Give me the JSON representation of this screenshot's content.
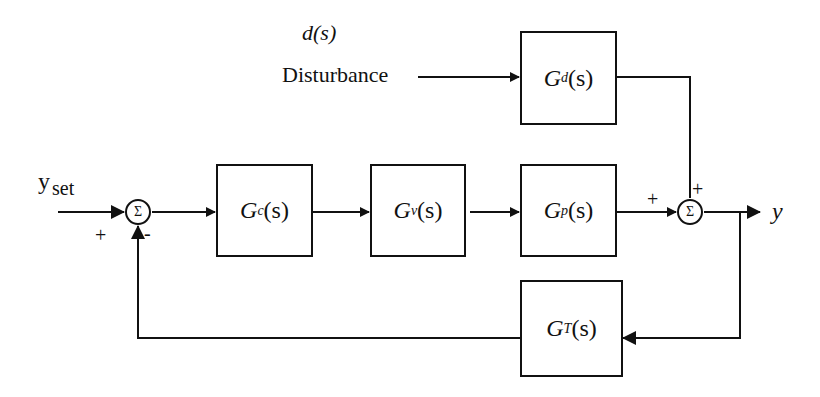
{
  "diagram": {
    "type": "feedback control block diagram",
    "inputs": {
      "setpoint": {
        "symbol": "y",
        "subscript": "set"
      },
      "disturbance_symbol": "d(s)",
      "disturbance_label": "Disturbance"
    },
    "output": {
      "symbol": "y"
    },
    "blocks": {
      "gc": {
        "G": "G",
        "sub": "c",
        "arg": "(s)"
      },
      "gv": {
        "G": "G",
        "sub": "v",
        "arg": "(s)"
      },
      "gp": {
        "G": "G",
        "sub": "p",
        "arg": "(s)"
      },
      "gd": {
        "G": "G",
        "sub": "d",
        "arg": "(s)"
      },
      "gt": {
        "G": "G",
        "sub": "T",
        "arg": "(s)"
      }
    },
    "summers": {
      "s1": {
        "symbol": "Σ",
        "sign_setpoint": "+",
        "sign_feedback": "-"
      },
      "s2": {
        "symbol": "Σ",
        "sign_process": "+",
        "sign_disturbance": "+"
      }
    }
  }
}
